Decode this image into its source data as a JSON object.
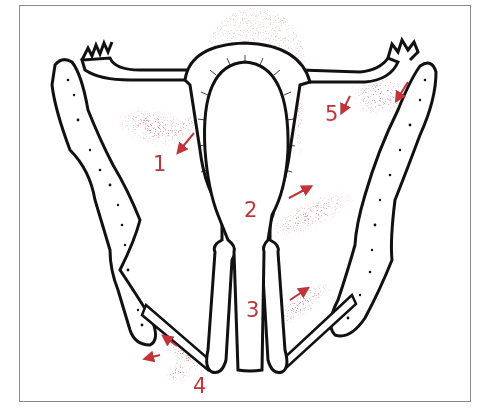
{
  "figure": {
    "title": "",
    "colors": {
      "outline": "#111111",
      "spread": "#c0343a",
      "frame": "#8a8a8a",
      "background": "#ffffff"
    }
  },
  "labels": [
    {
      "id": "1",
      "text": "1",
      "x": 153,
      "y": 160
    },
    {
      "id": "2",
      "text": "2",
      "x": 246,
      "y": 202
    },
    {
      "id": "3",
      "text": "3",
      "x": 247,
      "y": 302
    },
    {
      "id": "4",
      "text": "4",
      "x": 193,
      "y": 378
    },
    {
      "id": "5",
      "text": "5",
      "x": 326,
      "y": 105
    }
  ],
  "structures": [
    {
      "name": "uterus-body"
    },
    {
      "name": "uterine-cavity"
    },
    {
      "name": "left-fallopian-tube"
    },
    {
      "name": "right-fallopian-tube"
    },
    {
      "name": "cervix-vagina"
    },
    {
      "name": "left-pelvic-bone"
    },
    {
      "name": "right-pelvic-bone"
    },
    {
      "name": "left-levator"
    },
    {
      "name": "right-levator"
    }
  ]
}
